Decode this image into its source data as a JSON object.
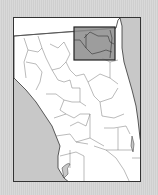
{
  "map": {
    "region": "North and Central Florida counties",
    "highlight": {
      "label": "selected-region",
      "fill": "#8c8c8c",
      "stroke": "#222222"
    },
    "colors": {
      "land": "#ffffff",
      "water": "#c8c8c8",
      "border": "#555555",
      "background": "#d6d6d6"
    }
  }
}
